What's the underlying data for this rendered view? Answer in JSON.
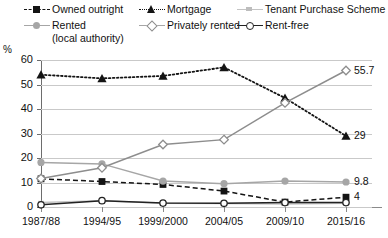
{
  "chart_data": {
    "type": "line",
    "title": "",
    "xlabel": "",
    "ylabel": "%",
    "ylim": [
      0,
      60
    ],
    "yticks": [
      0,
      10,
      20,
      30,
      40,
      50,
      60
    ],
    "grid": true,
    "legend_position": "top",
    "categories": [
      "1987/88",
      "1994/95",
      "1999/2000",
      "2004/05",
      "2009/10",
      "2015/16"
    ],
    "series": [
      {
        "name": "Owned outright",
        "marker": "filled-square",
        "line_style": "dashed",
        "color": "#141414",
        "values": [
          11.5,
          10.4,
          9.2,
          6.5,
          2.0,
          4.0
        ],
        "end_label": "4"
      },
      {
        "name": "Mortgage",
        "marker": "filled-triangle",
        "line_style": "dotted",
        "color": "#141414",
        "values": [
          54.0,
          52.5,
          53.5,
          57.0,
          44.5,
          29.0
        ],
        "end_label": "29"
      },
      {
        "name": "Tenant Purchase Scheme",
        "marker": "small-bar",
        "line_style": "solid",
        "color": "#c4c4c4",
        "values": [
          1.8,
          2.6,
          1.5,
          1.4,
          1.2,
          1.5
        ],
        "end_label": ""
      },
      {
        "name": "Rented (local authority)",
        "marker": "filled-circle",
        "line_style": "solid",
        "color": "#a6a6a6",
        "values": [
          18.2,
          17.6,
          10.6,
          9.5,
          10.6,
          10.2
        ],
        "end_label": "9.8"
      },
      {
        "name": "Privately rented",
        "marker": "hollow-diamond",
        "line_style": "solid",
        "color": "#8d8d8d",
        "values": [
          11.6,
          16.0,
          25.5,
          27.5,
          42.5,
          55.7
        ],
        "end_label": "55.7"
      },
      {
        "name": "Rent-free",
        "marker": "hollow-circle",
        "line_style": "solid",
        "color": "#222222",
        "values": [
          0.9,
          2.6,
          1.6,
          1.5,
          1.8,
          1.8
        ],
        "end_label": ""
      }
    ]
  },
  "legend": {
    "items": [
      {
        "label": "Owned outright"
      },
      {
        "label": "Mortgage"
      },
      {
        "label": "Tenant Purchase Scheme"
      },
      {
        "label": "Rented"
      },
      {
        "label": "Privately rented"
      },
      {
        "label": "Rent-free"
      }
    ],
    "rented_sub": "(local authority)"
  },
  "axis": {
    "unit": "%",
    "y_labels": [
      "60",
      "50",
      "40",
      "30",
      "20",
      "10",
      "0"
    ],
    "x_labels": [
      "1987/88",
      "1994/95",
      "1999/2000",
      "2004/05",
      "2009/10",
      "2015/16"
    ]
  },
  "end_labels": {
    "privately_rented": "55.7",
    "mortgage": "29",
    "rented": "9.8",
    "owned_outright": "4"
  }
}
